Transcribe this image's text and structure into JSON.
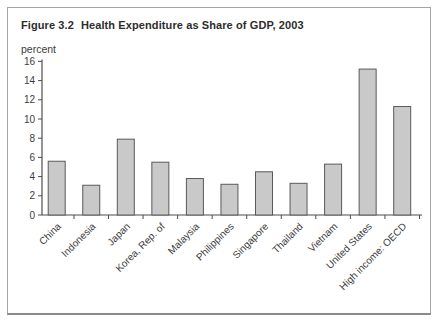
{
  "figure": {
    "number": "Figure 3.2",
    "title": "Health Expenditure as Share of GDP, 2003",
    "unit_label": "percent"
  },
  "chart_data": {
    "type": "bar",
    "xlabel": "",
    "ylabel": "percent",
    "categories": [
      "China",
      "Indonesia",
      "Japan",
      "Korea, Rep. of",
      "Malaysia",
      "Philippines",
      "Singapore",
      "Thailand",
      "Vietnam",
      "United States",
      "High income: OECD"
    ],
    "values": [
      5.6,
      3.1,
      7.9,
      5.5,
      3.8,
      3.2,
      4.5,
      3.3,
      5.3,
      15.2,
      11.3
    ],
    "ylim": [
      0,
      16
    ],
    "ytick_step": 2,
    "grid": false,
    "legend": "none",
    "bar_fill": "#c9c9c9",
    "bar_stroke": "#595959",
    "axis_color": "#4d4d4d"
  }
}
